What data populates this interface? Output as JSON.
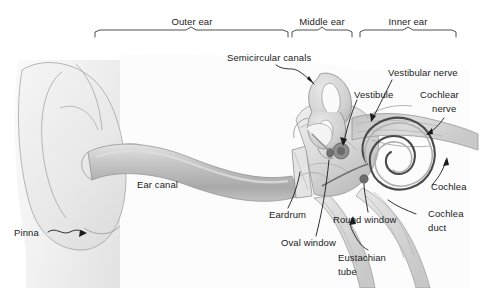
{
  "figure": {
    "background_color": "#ffffff",
    "line_color": "#3b3b3b",
    "text_color": "#1b1b1b"
  },
  "regions": [
    {
      "label": "Outer ear",
      "bracket_start_x": 95,
      "bracket_end_x": 288
    },
    {
      "label": "Middle ear",
      "bracket_start_x": 292,
      "bracket_end_x": 352
    },
    {
      "label": "Inner ear",
      "bracket_start_x": 360,
      "bracket_end_x": 456
    }
  ],
  "parts": [
    {
      "key": "semicircular_canals",
      "label": "Semicircular canals"
    },
    {
      "key": "vestibular_nerve",
      "label": "Vestibular nerve"
    },
    {
      "key": "vestibule",
      "label": "Vestibule"
    },
    {
      "key": "cochlear_nerve_1",
      "label": "Cochlear"
    },
    {
      "key": "cochlear_nerve_2",
      "label": "nerve"
    },
    {
      "key": "cochlea",
      "label": "Cochlea"
    },
    {
      "key": "cochlea_duct_1",
      "label": "Cochlea"
    },
    {
      "key": "cochlea_duct_2",
      "label": "duct"
    },
    {
      "key": "ear_canal",
      "label": "Ear canal"
    },
    {
      "key": "eardrum",
      "label": "Eardrum"
    },
    {
      "key": "oval_window",
      "label": "Oval window"
    },
    {
      "key": "round_window",
      "label": "Round window"
    },
    {
      "key": "eustachian_tube_1",
      "label": "Eustachian"
    },
    {
      "key": "eustachian_tube_2",
      "label": "tube"
    },
    {
      "key": "pinna",
      "label": "Pinna"
    }
  ],
  "palette": {
    "head_light": "#f2f2f2",
    "head_mid": "#e6e6e6",
    "canal_fill": "#c9c9c9",
    "canal_shade": "#a8a8a8",
    "bone_light": "#ededed",
    "bone_mid": "#d4d4d4",
    "bone_dark": "#9a9a9a",
    "nerve_fill": "#cfcfcf",
    "outline": "#555555",
    "spiral": "#4a4a4a"
  }
}
